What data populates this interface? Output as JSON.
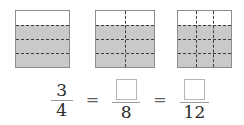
{
  "figure": {
    "shaded_color": "#c9c9c9",
    "outline_color": "#8c8c8c",
    "grid_color": "#3d3d3d",
    "models": [
      {
        "name": "fourths",
        "rows": 4,
        "cols": 1,
        "total_parts": 4,
        "shaded_parts": 3,
        "shaded_fraction": "3/4"
      },
      {
        "name": "eighths",
        "rows": 4,
        "cols": 2,
        "total_parts": 8,
        "shaded_parts": 6,
        "shaded_fraction": "6/8"
      },
      {
        "name": "twelfths",
        "rows": 4,
        "cols": 3,
        "total_parts": 12,
        "shaded_parts": 9,
        "shaded_fraction": "9/12"
      }
    ]
  },
  "equation": {
    "fraction_1": {
      "numerator": "3",
      "denominator": "4"
    },
    "equals_1": "=",
    "fraction_2": {
      "numerator": "",
      "numerator_is_blank": true,
      "denominator": "8"
    },
    "equals_2": "=",
    "fraction_3": {
      "numerator": "",
      "numerator_is_blank": true,
      "denominator": "12"
    }
  }
}
